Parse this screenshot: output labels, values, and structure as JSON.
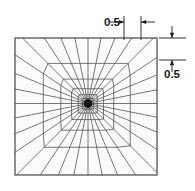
{
  "figure": {
    "background_color": "#ffffff",
    "line_color": "#4a4a4a",
    "boundary_color": "#555555",
    "annotation_color": "#1a1a1a",
    "domain_fill": "#fbfbfb"
  },
  "mesh": {
    "type": "radial-polar",
    "center_x": 88,
    "center_y": 103.5,
    "square": {
      "left": 15,
      "top": 38,
      "right": 157,
      "bottom": 175
    },
    "spoke_count": 32,
    "ring_count": 9,
    "ring_growth_ratio": 1.62,
    "innermost_ring_fraction": 0.035,
    "description": "radial spokes from center to square boundary with geometrically graded concentric rings"
  },
  "annotations": {
    "top_dimension": {
      "label": "0.5",
      "orientation": "horizontal",
      "arrow_style": "inward",
      "text_x": 112,
      "text_y": 26,
      "extension_line_1_x": 124,
      "extension_line_2_x": 141,
      "extension_top_y": 16,
      "extension_bottom_y": 40,
      "arrow_y": 22
    },
    "right_dimension": {
      "label": "0.5",
      "orientation": "vertical",
      "arrow_style": "inward",
      "text_x": 172,
      "text_y": 78,
      "tick_line_1_y": 38,
      "tick_line_2_y": 60,
      "tick_left_x": 159,
      "tick_right_x": 186,
      "arrow_x": 172
    }
  },
  "chart_data": {
    "type": "diagram",
    "values": [
      0.5,
      0.5
    ],
    "labels": [
      "0.5",
      "0.5"
    ]
  }
}
